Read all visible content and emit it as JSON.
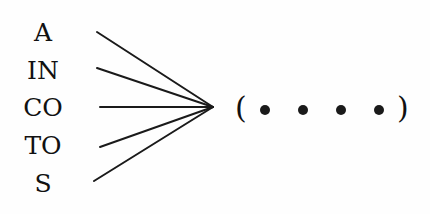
{
  "diagram": {
    "left_labels": [
      "A",
      "IN",
      "CO",
      "TO",
      "S"
    ],
    "target": {
      "open": "(",
      "dots": [
        "•",
        "•",
        "•",
        "•"
      ],
      "close": ")"
    },
    "line_color": "#1a1a1a",
    "text_color": "#111111"
  }
}
